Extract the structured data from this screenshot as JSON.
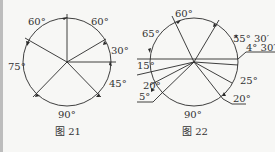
{
  "figures": [
    {
      "caption": "图 21",
      "angles": [
        "60°",
        "60°",
        "30°",
        "75°",
        "45°",
        "90°"
      ]
    },
    {
      "caption": "图 22",
      "angles": [
        "60°",
        "65°",
        "55° 30′",
        "4° 30′",
        "15°",
        "25°",
        "20°",
        "5°",
        "20°",
        "90°"
      ]
    }
  ],
  "colors": {
    "line": "#2a2a2a",
    "background": "#f7f7f5",
    "text": "#333333"
  }
}
